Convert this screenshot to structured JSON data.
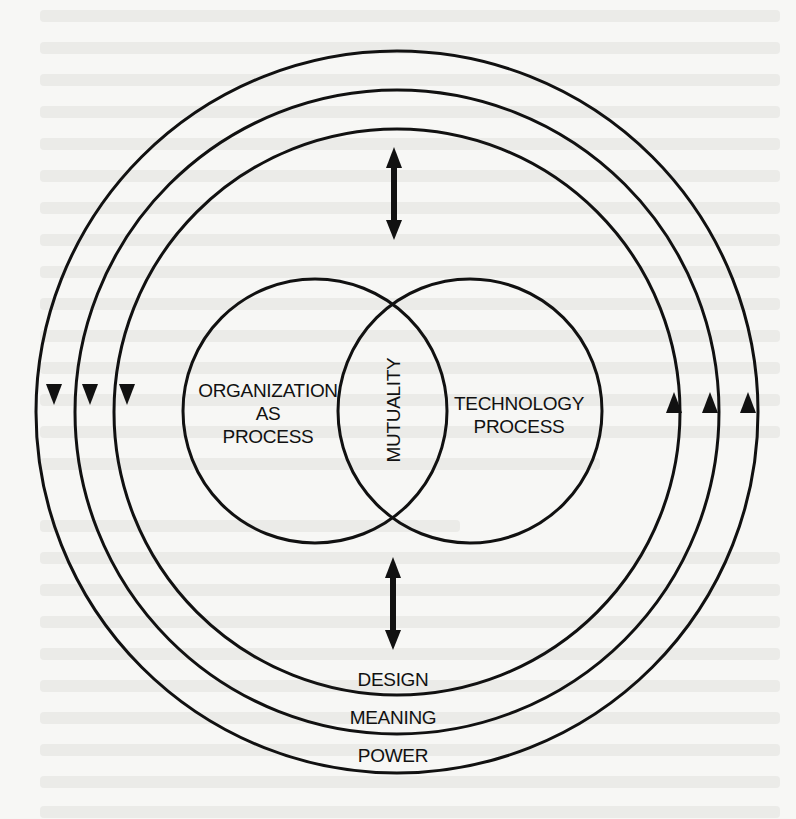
{
  "diagram": {
    "type": "concentric-venn-cycle",
    "inner_circles": [
      {
        "id": "organization",
        "label_lines": [
          "ORGANIZATION",
          "AS",
          "PROCESS"
        ]
      },
      {
        "id": "technology",
        "label_lines": [
          "TECHNOLOGY",
          "PROCESS"
        ]
      }
    ],
    "overlap_label": "MUTUALITY",
    "outer_rings": [
      {
        "label": "DESIGN",
        "direction": "counterclockwise-flow"
      },
      {
        "label": "MEANING",
        "direction": "counterclockwise-flow"
      },
      {
        "label": "POWER",
        "direction": "counterclockwise-flow"
      }
    ],
    "arrows": {
      "left_side": "downward",
      "right_side": "upward",
      "center_top": "bidirectional-vertical",
      "center_bottom": "bidirectional-vertical"
    },
    "colors": {
      "ink": "#111111",
      "paper": "#f7f7f5",
      "bleed_through": "#e9e9e6"
    }
  }
}
